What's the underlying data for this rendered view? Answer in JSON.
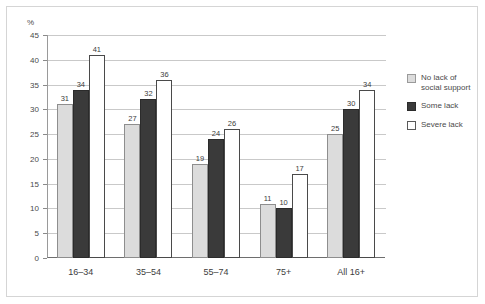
{
  "chart_data": {
    "type": "bar",
    "title": "",
    "xlabel": "",
    "ylabel": "%",
    "ylim": [
      0,
      45
    ],
    "yticks": [
      0,
      5,
      10,
      15,
      20,
      25,
      30,
      35,
      40,
      45
    ],
    "grid": true,
    "legend_position": "right",
    "categories": [
      "16–34",
      "35–54",
      "55–74",
      "75+",
      "All 16+"
    ],
    "series": [
      {
        "name": "No lack of social support",
        "color": "#dcdcdc",
        "values": [
          31,
          34,
          19,
          11,
          25
        ]
      },
      {
        "name": "Some lack",
        "color": "#3a3a3a",
        "values": [
          34,
          32,
          24,
          10,
          30
        ]
      },
      {
        "name": "Severe lack",
        "color": "#ffffff",
        "values": [
          41,
          36,
          26,
          17,
          34
        ]
      }
    ],
    "groups": [
      {
        "category": "16–34",
        "values": [
          31,
          34,
          41
        ]
      },
      {
        "category": "35–54",
        "values": [
          27,
          32,
          36
        ]
      },
      {
        "category": "55–74",
        "values": [
          19,
          24,
          26
        ]
      },
      {
        "category": "75+",
        "values": [
          11,
          10,
          17
        ]
      },
      {
        "category": "All 16+",
        "values": [
          25,
          30,
          34
        ]
      }
    ]
  },
  "legend": {
    "items": [
      {
        "label": "No lack of social support",
        "swatch": "s0"
      },
      {
        "label": "Some lack",
        "swatch": "s1"
      },
      {
        "label": "Severe lack",
        "swatch": "s2"
      }
    ]
  }
}
